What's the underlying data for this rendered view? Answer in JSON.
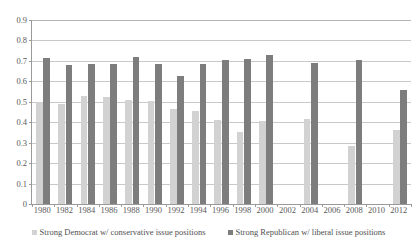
{
  "chart_data": {
    "type": "bar",
    "title": "",
    "subtitle": "",
    "xlabel": "",
    "ylabel": "",
    "ylim": [
      0,
      0.9
    ],
    "ytick_labels": [
      "0.9",
      "0.8",
      "0.7",
      "0.6",
      "0.5",
      "0.4",
      "0.3",
      "0.2",
      "0.1",
      "0"
    ],
    "ytick_values": [
      0.9,
      0.8,
      0.7,
      0.6,
      0.5,
      0.4,
      0.3,
      0.2,
      0.1,
      0
    ],
    "grid": true,
    "legend_position": "bottom",
    "categories": [
      "1980",
      "1982",
      "1984",
      "1986",
      "1988",
      "1990",
      "1992",
      "1994",
      "1996",
      "1998",
      "2000",
      "2002",
      "2004",
      "2006",
      "2008",
      "2010",
      "2012"
    ],
    "series": [
      {
        "name": "Strong Democrat w/ conservative issue positions",
        "color": "#d2d2d2",
        "values": [
          0.5,
          0.49,
          0.53,
          0.525,
          0.51,
          0.505,
          0.465,
          0.455,
          0.41,
          0.35,
          0.405,
          null,
          0.415,
          null,
          0.285,
          null,
          0.36
        ]
      },
      {
        "name": "Strong Republican w/ liberal issue positions",
        "color": "#7d7d7d",
        "values": [
          0.715,
          0.68,
          0.685,
          0.685,
          0.72,
          0.685,
          0.625,
          0.685,
          0.705,
          0.71,
          0.73,
          null,
          0.69,
          null,
          0.705,
          null,
          0.56
        ]
      }
    ]
  },
  "legend": {
    "items": [
      {
        "label": "Strong Democrat w/ conservative issue positions"
      },
      {
        "label": "Strong Republican w/ liberal issue positions"
      }
    ]
  }
}
